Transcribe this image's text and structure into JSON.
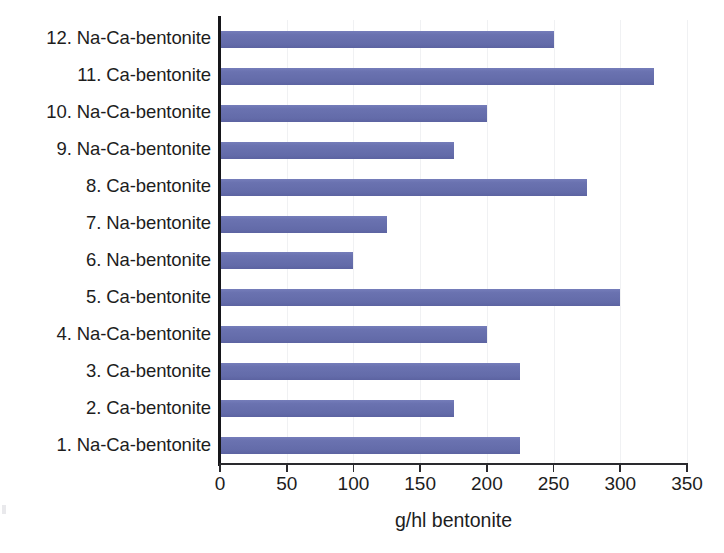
{
  "chart_data": {
    "type": "bar",
    "orientation": "horizontal",
    "title": "",
    "xlabel": "g/hl bentonite",
    "ylabel": "",
    "xlim": [
      0,
      350
    ],
    "xticks": [
      0,
      50,
      100,
      150,
      200,
      250,
      300,
      350
    ],
    "grid": "vertical-only",
    "legend": "none",
    "series_color": "#6A72B0",
    "categories": [
      "1. Na-Ca-bentonite",
      "2. Ca-bentonite",
      "3. Ca-bentonite",
      "4. Na-Ca-bentonite",
      "5. Ca-bentonite",
      "6. Na-bentonite",
      "7. Na-bentonite",
      "8. Ca-bentonite",
      "9. Na-Ca-bentonite",
      "10. Na-Ca-bentonite",
      "11. Ca-bentonite",
      "12. Na-Ca-bentonite"
    ],
    "values": [
      225,
      175,
      225,
      200,
      300,
      100,
      125,
      275,
      175,
      200,
      325,
      250
    ],
    "category_order_top_to_bottom": [
      "12. Na-Ca-bentonite",
      "11. Ca-bentonite",
      "10. Na-Ca-bentonite",
      "9. Na-Ca-bentonite",
      "8. Ca-bentonite",
      "7. Na-bentonite",
      "6. Na-bentonite",
      "5. Ca-bentonite",
      "4. Na-Ca-bentonite",
      "3. Ca-bentonite",
      "2. Ca-bentonite",
      "1. Na-Ca-bentonite"
    ],
    "values_top_to_bottom": [
      250,
      325,
      200,
      175,
      275,
      125,
      100,
      300,
      200,
      225,
      175,
      225
    ]
  },
  "axis": {
    "x_title": "g/hl bentonite",
    "tick_labels": [
      "0",
      "50",
      "100",
      "150",
      "200",
      "250",
      "300",
      "350"
    ]
  }
}
